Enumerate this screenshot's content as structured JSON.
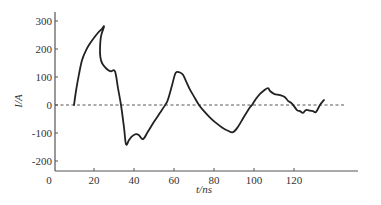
{
  "chart_data": {
    "type": "line",
    "title": "",
    "xlabel": "t/ns",
    "ylabel": "I/A",
    "xlim": [
      0,
      160
    ],
    "ylim": [
      -235,
      330
    ],
    "x_ticks": [
      0,
      20,
      40,
      60,
      80,
      100,
      120
    ],
    "y_ticks": [
      -200,
      -100,
      0,
      100,
      200,
      300
    ],
    "x_tick_labels": [
      "0",
      "20",
      "40",
      "60",
      "80",
      "100",
      "120"
    ],
    "y_tick_labels": [
      "-200",
      "-100",
      "0",
      "100",
      "200",
      "300"
    ],
    "reference_line": {
      "y": 0,
      "style": "dashed"
    },
    "grid": false,
    "legend": null,
    "series": [
      {
        "name": "I",
        "x": [
          10,
          11,
          12.5,
          14,
          16,
          18,
          20,
          22,
          24,
          25,
          23.5,
          23,
          23.2,
          24,
          25.5,
          27,
          28.5,
          30.5,
          32,
          33.5,
          35,
          36,
          37.5,
          39,
          41,
          42.5,
          44.5,
          47,
          50,
          53,
          56,
          57,
          59,
          60.5,
          61.5,
          63,
          64.5,
          66,
          68,
          70,
          72.5,
          75,
          78,
          81,
          84,
          87,
          89.5,
          92,
          95,
          98,
          99,
          101,
          103,
          105,
          107,
          108,
          110,
          113,
          115.5,
          117,
          119,
          121.5,
          123,
          124.5,
          126,
          128,
          129.5,
          131,
          133,
          135
        ],
        "y": [
          0,
          50,
          110,
          160,
          195,
          220,
          240,
          258,
          272,
          280,
          245,
          200,
          170,
          150,
          135,
          125,
          120,
          120,
          60,
          0,
          -80,
          -140,
          -125,
          -112,
          -104,
          -108,
          -122,
          -95,
          -60,
          -28,
          5,
          20,
          70,
          110,
          118,
          116,
          108,
          85,
          55,
          30,
          0,
          -22,
          -45,
          -64,
          -80,
          -92,
          -97,
          -78,
          -42,
          -8,
          0,
          22,
          40,
          52,
          60,
          50,
          40,
          35,
          28,
          15,
          5,
          -18,
          -22,
          -28,
          -18,
          -20,
          -22,
          -25,
          0,
          18
        ]
      }
    ]
  }
}
